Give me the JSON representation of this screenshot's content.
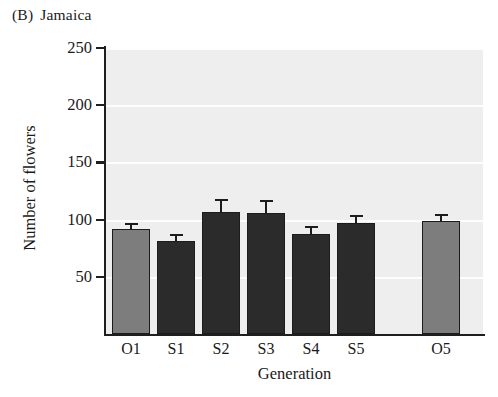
{
  "chart_data": {
    "type": "bar",
    "panel_tag": "(B)",
    "panel_name": "Jamaica",
    "xlabel": "Generation",
    "ylabel": "Number of flowers",
    "categories": [
      "O1",
      "S1",
      "S2",
      "S3",
      "S4",
      "S5",
      "O5"
    ],
    "values": [
      92,
      81,
      107,
      106,
      87,
      97,
      99
    ],
    "errors": [
      5,
      6,
      11,
      11,
      7,
      7,
      6
    ],
    "group_of": [
      "open",
      "selfed",
      "selfed",
      "selfed",
      "selfed",
      "selfed",
      "open"
    ],
    "ylim": [
      0,
      250
    ],
    "yticks": [
      50,
      100,
      150,
      200,
      250
    ],
    "ytick_labels": [
      "50",
      "100",
      "150",
      "200",
      "250"
    ],
    "grid": true,
    "legend": "none",
    "colors": {
      "open_bar": "#7d7d7d",
      "selfed_bar": "#2b2b2b",
      "bar_edge": "#1c1c1c",
      "plot_background": "#eeeeee",
      "gridline": "#fdfdfd",
      "axis": "#1f1f1f",
      "text": "#1a1a1a"
    }
  }
}
